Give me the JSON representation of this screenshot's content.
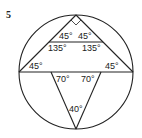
{
  "problem_number": "5",
  "figure": {
    "circle": {
      "cx": 76,
      "cy": 72,
      "r": 57
    },
    "angles": {
      "top_left": "45°",
      "top_right": "45°",
      "mid_left": "135°",
      "mid_right": "135°",
      "diam_left": "45°",
      "diam_right": "45°",
      "lower_left": "70°",
      "lower_right": "70°",
      "bottom": "40°"
    },
    "stroke_color": "#222222"
  }
}
